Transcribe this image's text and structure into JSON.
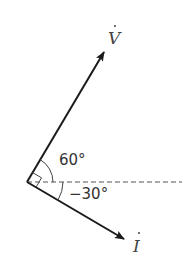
{
  "diagram": {
    "type": "phasor-diagram",
    "origin": [
      27,
      182
    ],
    "reference_axis": {
      "style": "dashed",
      "direction": "horizontal"
    },
    "vectors": [
      {
        "name": "V",
        "label": "V",
        "has_dot": true,
        "angle_deg": 60
      },
      {
        "name": "I",
        "label": "I",
        "has_dot": true,
        "angle_deg": -30
      }
    ],
    "angle_labels": {
      "v_angle": "60°",
      "i_angle": "−30°"
    },
    "right_angle_marker": true,
    "colors": {
      "lines": "#1a1a1a",
      "text": "#333333",
      "dashed": "#555555"
    }
  }
}
